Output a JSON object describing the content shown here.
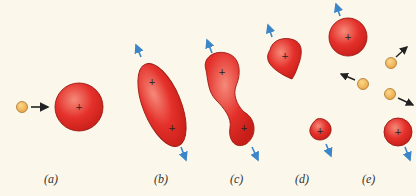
{
  "figure": {
    "colors": {
      "background": "#fbf7ea",
      "nucleus_fill": "#e4302a",
      "nucleus_highlight": "#f58a7a",
      "nucleus_edge": "#9a1a14",
      "neutron_fill": "#f2b457",
      "neutron_edge": "#a8742a",
      "motion_arrow": "#3b86c8",
      "neutron_arrow": "#222222"
    },
    "panels": [
      {
        "id": "a",
        "label": "(a)",
        "content": "neutron approaching spherical nucleus"
      },
      {
        "id": "b",
        "label": "(b)",
        "content": "nucleus elongates into ellipsoid with two charge centers"
      },
      {
        "id": "c",
        "label": "(c)",
        "content": "dumbbell-shaped nucleus with neck"
      },
      {
        "id": "d",
        "label": "(d)",
        "content": "nucleus splits into two fragments"
      },
      {
        "id": "e",
        "label": "(e)",
        "content": "two spherical fragments fly apart emitting three neutrons"
      }
    ],
    "plus_symbol": "+"
  }
}
